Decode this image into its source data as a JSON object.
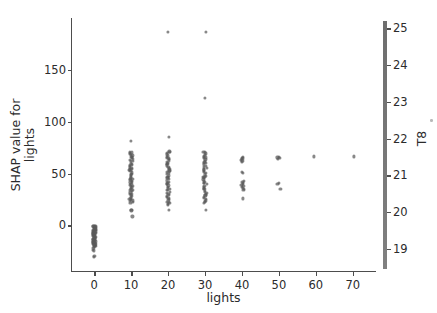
{
  "chart_data": {
    "type": "scatter",
    "title": "",
    "xlabel": "lights",
    "ylabel": "SHAP value for\nlights",
    "ylabel_line1": "SHAP value for",
    "ylabel_line2": "lights",
    "xlim": [
      -6,
      76
    ],
    "ylim": [
      -45,
      200
    ],
    "xticks": [
      0,
      10,
      20,
      30,
      40,
      50,
      60,
      70
    ],
    "xtick_labels": [
      "0",
      "10",
      "20",
      "30",
      "40",
      "50",
      "60",
      "70"
    ],
    "yticks": [
      0,
      50,
      100,
      150
    ],
    "ytick_labels": [
      "0",
      "50",
      "100",
      "150"
    ],
    "grid": false,
    "legend": "none",
    "marker_color": "#5a5a5a",
    "axis_color": "#4d4d4d",
    "colorbar": {
      "label": "T8",
      "ticks": [
        19,
        20,
        21,
        22,
        23,
        24,
        25
      ],
      "tick_labels": [
        "19",
        "20",
        "21",
        "22",
        "23",
        "24",
        "25"
      ],
      "vmin": 18.45,
      "vmax": 25.2,
      "gradient_low": "#808080",
      "gradient_high": "#6e6e6e",
      "orientation": "vertical",
      "position": "right"
    },
    "series": [
      {
        "name": "lights = 0",
        "x": 0,
        "values": [
          -0.4,
          -1.0,
          -1.6,
          -2.2,
          -2.8,
          -3.4,
          -4.0,
          -4.6,
          -5.2,
          -5.8,
          -6.4,
          -7.0,
          -7.6,
          -8.2,
          -8.8,
          -9.4,
          -10.0,
          -10.6,
          -11.2,
          -11.8,
          -12.4,
          -13.0,
          -13.6,
          -14.2,
          -14.8,
          -15.4,
          -16.0,
          -16.6,
          -17.2,
          -17.8,
          -18.4,
          -19.0,
          -19.6,
          -20.2,
          -0.8,
          -2.5,
          -4.2,
          -6.0,
          -7.8,
          -9.5,
          -11.2,
          -13.0,
          -14.6,
          -16.4,
          -18.0,
          -19.4,
          -23.5,
          -24.2,
          -29.5,
          -30.2,
          -0.2,
          -1.3,
          -3.1,
          -5.0,
          -6.8,
          -8.6,
          -10.4,
          -12.2,
          -14.0,
          -15.8,
          -17.5,
          -19.2,
          -20.8,
          -21.6
        ]
      },
      {
        "name": "lights = 10",
        "x": 10,
        "values": [
          81.5,
          71.2,
          70.4,
          69.5,
          68.6,
          67.5,
          66.4,
          65.3,
          64.2,
          63.0,
          61.8,
          60.6,
          59.4,
          58.2,
          57.0,
          55.8,
          54.6,
          53.4,
          52.2,
          51.0,
          49.8,
          48.6,
          47.4,
          46.2,
          45.0,
          43.8,
          42.6,
          41.4,
          40.2,
          39.0,
          37.8,
          36.6,
          35.4,
          34.2,
          33.0,
          31.8,
          30.6,
          29.4,
          28.2,
          27.0,
          25.8,
          24.6,
          23.4,
          22.4,
          21.6,
          15.0,
          14.4,
          8.6,
          66.0,
          62.0,
          58.0,
          54.0,
          50.0,
          46.0,
          42.0,
          38.0,
          34.0,
          30.0,
          26.0,
          24.0,
          68.0,
          55.5,
          44.5,
          36.5
        ]
      },
      {
        "name": "lights = 20",
        "x": 20,
        "values": [
          186.5,
          85.0,
          71.4,
          70.5,
          69.6,
          68.5,
          67.4,
          66.2,
          65.0,
          63.8,
          62.6,
          61.4,
          60.2,
          59.0,
          57.8,
          56.6,
          55.4,
          54.2,
          53.0,
          51.8,
          50.6,
          49.4,
          48.2,
          47.0,
          45.8,
          44.6,
          43.4,
          42.2,
          41.0,
          39.8,
          38.6,
          37.4,
          36.2,
          35.0,
          33.8,
          32.6,
          31.4,
          30.2,
          29.0,
          27.8,
          26.6,
          25.4,
          24.2,
          23.0,
          21.8,
          20.6,
          19.4,
          14.6,
          64.5,
          59.5,
          52.5,
          46.5,
          40.5,
          34.5,
          28.5,
          22.5
        ]
      },
      {
        "name": "lights = 30",
        "x": 30,
        "values": [
          186.5,
          123.0,
          71.2,
          70.3,
          69.4,
          68.3,
          67.2,
          66.0,
          64.8,
          63.6,
          62.4,
          61.2,
          60.0,
          58.8,
          57.6,
          56.4,
          55.2,
          54.0,
          52.8,
          51.6,
          50.4,
          49.2,
          48.0,
          46.8,
          45.6,
          44.4,
          43.2,
          42.0,
          40.8,
          39.6,
          38.4,
          37.2,
          36.0,
          34.8,
          33.6,
          32.4,
          31.2,
          30.0,
          28.8,
          27.6,
          26.4,
          25.2,
          24.0,
          22.8,
          21.6,
          14.6,
          65.5,
          60.5,
          54.0,
          47.0,
          41.0,
          35.0,
          29.0,
          23.5
        ]
      },
      {
        "name": "lights = 40",
        "x": 40,
        "values": [
          66.2,
          65.4,
          64.6,
          63.8,
          63.0,
          62.2,
          61.4,
          51.5,
          50.6,
          43.0,
          42.0,
          41.0,
          40.0,
          39.0,
          38.0,
          37.0,
          36.0,
          35.0,
          34.2,
          26.0
        ]
      },
      {
        "name": "lights = 50",
        "x": 50,
        "values": [
          66.4,
          65.6,
          64.8,
          63.9,
          40.8,
          39.8,
          35.2
        ]
      },
      {
        "name": "lights = 60",
        "x": 60,
        "values": [
          66.5
        ]
      },
      {
        "name": "lights = 70",
        "x": 70,
        "values": [
          66.5
        ]
      }
    ]
  }
}
